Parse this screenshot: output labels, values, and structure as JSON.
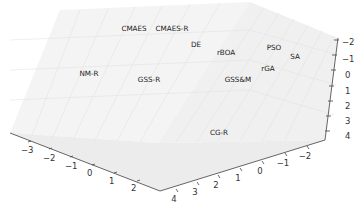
{
  "chart_data": {
    "type": "scatter",
    "projection": "3d",
    "title": "",
    "xlabel": "",
    "ylabel": "",
    "zlabel": "",
    "grid": true,
    "x_axis": {
      "ticks": [
        -3,
        -2,
        -1,
        0,
        1,
        2
      ],
      "range": [
        -3.5,
        2.5
      ]
    },
    "y_axis": {
      "ticks": [
        4,
        3,
        2,
        1,
        0,
        -1,
        -2
      ],
      "range": [
        4.5,
        -2.5
      ]
    },
    "z_axis": {
      "ticks": [
        -2,
        -1,
        0,
        1,
        2,
        3,
        4
      ],
      "range": [
        -2.5,
        4.5
      ],
      "inverted": true
    },
    "points": [
      {
        "label": "CMAES",
        "px": 134,
        "py": 31
      },
      {
        "label": "CMAES-R",
        "px": 172,
        "py": 31
      },
      {
        "label": "DE",
        "px": 196,
        "py": 47
      },
      {
        "label": "rBOA",
        "px": 226,
        "py": 55
      },
      {
        "label": "PSO",
        "px": 274,
        "py": 50
      },
      {
        "label": "SA",
        "px": 295,
        "py": 59
      },
      {
        "label": "rGA",
        "px": 268,
        "py": 71
      },
      {
        "label": "GSS&M",
        "px": 238,
        "py": 82
      },
      {
        "label": "NM-R",
        "px": 89,
        "py": 76
      },
      {
        "label": "GSS-R",
        "px": 149,
        "py": 82
      },
      {
        "label": "CG-R",
        "px": 219,
        "py": 135
      }
    ]
  },
  "axes": {
    "left_axis_ticks": [
      {
        "label": "−3",
        "x": 21,
        "y": 153,
        "tx": 31,
        "ty": 141
      },
      {
        "label": "−2",
        "x": 43,
        "y": 161,
        "tx": 52,
        "ty": 148
      },
      {
        "label": "−1",
        "x": 65,
        "y": 169,
        "tx": 73,
        "ty": 156
      },
      {
        "label": "0",
        "x": 87,
        "y": 176,
        "tx": 95,
        "ty": 164
      },
      {
        "label": "1",
        "x": 109,
        "y": 184,
        "tx": 117,
        "ty": 172
      },
      {
        "label": "2",
        "x": 131,
        "y": 191,
        "tx": 140,
        "ty": 180
      }
    ],
    "right_axis_ticks": [
      {
        "label": "4",
        "x": 4,
        "y": 193,
        "tx": 176,
        "ty": 189
      },
      {
        "label": "3",
        "x": 26,
        "y": 188,
        "tx": 197,
        "ty": 182
      },
      {
        "label": "2",
        "x": 48,
        "y": 182,
        "tx": 218,
        "ty": 175
      },
      {
        "label": "1",
        "x": 69,
        "y": 176,
        "tx": 240,
        "ty": 168
      },
      {
        "label": "0",
        "x": 92,
        "y": 169,
        "tx": 262,
        "ty": 161
      },
      {
        "label": "−1",
        "x": 113,
        "y": 163,
        "tx": 285,
        "ty": 153
      },
      {
        "label": "−2",
        "x": 133,
        "y": 157,
        "tx": 307,
        "ty": 146
      }
    ],
    "vertical_axis_ticks": [
      {
        "label": "−2",
        "x": 342,
        "y": 42,
        "tx": 336,
        "ty": 40
      },
      {
        "label": "−1",
        "x": 342,
        "y": 59,
        "tx": 334,
        "ty": 55
      },
      {
        "label": "0",
        "x": 345,
        "y": 75,
        "tx": 333,
        "ty": 70
      },
      {
        "label": "1",
        "x": 345,
        "y": 91,
        "tx": 331,
        "ty": 86
      },
      {
        "label": "2",
        "x": 345,
        "y": 106,
        "tx": 330,
        "ty": 101
      },
      {
        "label": "3",
        "x": 345,
        "y": 121,
        "tx": 328,
        "ty": 116
      },
      {
        "label": "4",
        "x": 345,
        "y": 136,
        "tx": 327,
        "ty": 131
      }
    ]
  }
}
